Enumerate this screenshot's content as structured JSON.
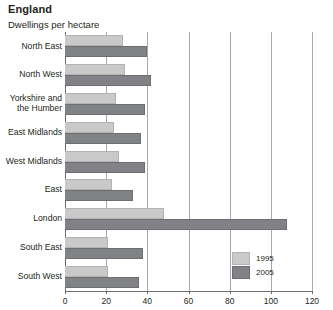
{
  "chart_data": {
    "type": "bar",
    "orientation": "horizontal",
    "title": "England",
    "subtitle": "Dwellings per hectare",
    "xlabel": "",
    "ylabel": "",
    "xlim": [
      0,
      120
    ],
    "xticks": [
      0,
      20,
      40,
      60,
      80,
      100,
      120
    ],
    "xtick_labels": [
      "0",
      "20",
      "40",
      "60",
      "80",
      "100",
      "120"
    ],
    "grid": true,
    "legend_position": "bottom-right",
    "categories": [
      "North East",
      "North West",
      "Yorkshire and the Humber",
      "East Midlands",
      "West Midlands",
      "East",
      "London",
      "South East",
      "South West"
    ],
    "category_lines": [
      [
        "North East"
      ],
      [
        "North West"
      ],
      [
        "Yorkshire and",
        "the Humber"
      ],
      [
        "East Midlands"
      ],
      [
        "West Midlands"
      ],
      [
        "East"
      ],
      [
        "London"
      ],
      [
        "South East"
      ],
      [
        "South West"
      ]
    ],
    "series": [
      {
        "name": "1995",
        "color": "#c9c9c9",
        "values": [
          28,
          29,
          25,
          24,
          26,
          23,
          48,
          21,
          21
        ]
      },
      {
        "name": "2005",
        "color": "#808285",
        "values": [
          40,
          42,
          39,
          37,
          39,
          33,
          108,
          38,
          36
        ]
      }
    ]
  },
  "legend": {
    "items": [
      {
        "label": "1995"
      },
      {
        "label": "2005"
      }
    ]
  }
}
